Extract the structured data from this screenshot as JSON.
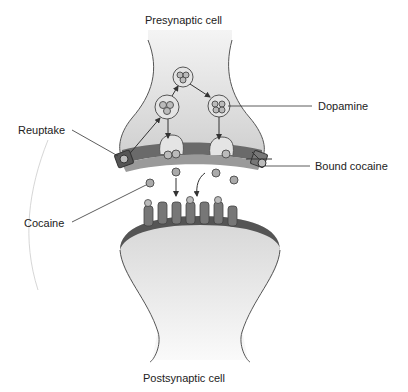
{
  "labels": {
    "presynaptic": "Presynaptic cell",
    "postsynaptic": "Postsynaptic cell",
    "reuptake": "Reuptake",
    "dopamine": "Dopamine",
    "bound_cocaine": "Bound cocaine",
    "cocaine": "Cocaine"
  },
  "colors": {
    "cell_fill": "#d9d9d9",
    "membrane_dark": "#555555",
    "membrane_mid": "#8a8a8a",
    "outline": "#555555",
    "text": "#222222"
  }
}
